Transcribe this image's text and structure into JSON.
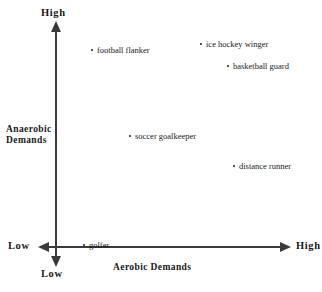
{
  "chart_data": {
    "type": "scatter",
    "title": "",
    "xlabel": "Aerobic  Demands",
    "ylabel": "Anaerobic Demands",
    "xlim": [
      0,
      100
    ],
    "ylim": [
      0,
      100
    ],
    "grid": false,
    "legend": "none",
    "axis_captions": {
      "y_high": "High",
      "y_low": "Low",
      "x_low": "Low",
      "x_high": "High"
    },
    "points": [
      {
        "label": "football flanker",
        "x": 16,
        "y": 89,
        "px": 92,
        "py": 50
      },
      {
        "label": "ice hockey winger",
        "x": 65,
        "y": 92,
        "px": 201,
        "py": 44
      },
      {
        "label": "basketball guard",
        "x": 77,
        "y": 83,
        "px": 228,
        "py": 66
      },
      {
        "label": "soccer goalkeeper",
        "x": 33,
        "y": 51,
        "px": 130,
        "py": 136
      },
      {
        "label": "distance runner",
        "x": 79,
        "y": 38,
        "px": 234,
        "py": 166
      },
      {
        "label": "golfer",
        "x": 13,
        "y": 1,
        "px": 84,
        "py": 245
      }
    ]
  },
  "colors": {
    "axis": "#3a3a3a",
    "text": "#1a1a1a",
    "background": "#ffffff"
  }
}
